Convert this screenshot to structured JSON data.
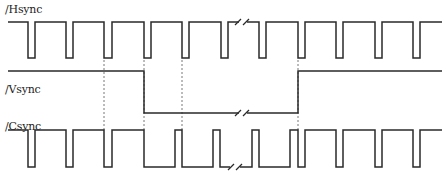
{
  "diagram": {
    "type": "timing-diagram",
    "signals": [
      {
        "id": "hsync",
        "label": "/Hsync",
        "high_y": 22,
        "low_y": 58,
        "pulses": [
          [
            28,
            35
          ],
          [
            66,
            73
          ],
          [
            104,
            112
          ],
          [
            144,
            151
          ],
          [
            182,
            189
          ],
          [
            221,
            228
          ],
          [
            259,
            266
          ],
          [
            298,
            305
          ],
          [
            336,
            343
          ],
          [
            375,
            382
          ],
          [
            413,
            420
          ]
        ],
        "start_x": 8,
        "end_x": 442,
        "break_x": [
          238,
          247
        ]
      },
      {
        "id": "vsync",
        "label": "/Vsync",
        "high_y": 71,
        "low_y": 113,
        "fall_x": 144,
        "rise_x": 298,
        "start_x": 8,
        "end_x": 442,
        "break_x": [
          238,
          247
        ]
      },
      {
        "id": "csync",
        "label": "/Csync",
        "high_y": 130,
        "low_y": 167,
        "start_x": 8,
        "end_x": 442,
        "break_x": [
          246,
          255
        ]
      }
    ],
    "dashed_guides_x": [
      104,
      144,
      182,
      298
    ],
    "colors": {
      "line": "#2a2a2a",
      "guide": "#555555",
      "background": "#ffffff"
    }
  }
}
